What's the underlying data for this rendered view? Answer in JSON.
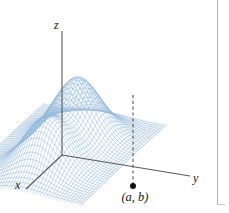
{
  "figure": {
    "kind": "3d-surface-plot",
    "background_color": "#ffffff",
    "border_color": "#b2b2b2",
    "axes": {
      "origin": [
        62,
        155
      ],
      "z_axis": {
        "label": "z",
        "from": [
          62,
          155
        ],
        "to": [
          62,
          31
        ]
      },
      "x_axis": {
        "label": "x",
        "from": [
          62,
          155
        ],
        "to": [
          26,
          189
        ]
      },
      "y_axis": {
        "label": "y",
        "from": [
          62,
          155
        ],
        "to": [
          190,
          176
        ]
      },
      "color": "#5a5a5a"
    },
    "annotations": {
      "point_label": "(a, b)",
      "point_marker": {
        "x": 133,
        "y": 186,
        "radius": 3.0,
        "color": "#111111"
      },
      "drop_line": {
        "from": [
          133,
          95
        ],
        "to": [
          133,
          184
        ],
        "style": "dashed",
        "color": "#555555"
      }
    }
  },
  "chart_data": {
    "type": "line",
    "title": "",
    "subtitle": "",
    "xlabel": "x",
    "ylabel": "y",
    "zlabel": "z",
    "surface_description": "Two-humped wireframe surface with a saddle (local minimum along the ridge) between the peaks; a dashed vertical line drops from the saddle point down to the labelled point (a, b) in the xy-plane.",
    "mesh": {
      "style": "wireframe-crosshatch",
      "line_color": "#7aa8d2",
      "fill_color": "#ffffff",
      "u_lines": 44,
      "v_lines": 46,
      "line_width": 0.45,
      "opacity": 0.8
    },
    "projection": {
      "origin_px": [
        62,
        155
      ],
      "x_unit_px": [
        -0.62,
        0.585
      ],
      "y_unit_px": [
        1.0,
        0.175
      ],
      "z_unit_px": [
        0.0,
        -1.0
      ],
      "z_scale_px": 62
    },
    "surface_function": "z = exp(-(u+0.95)^2 - 0.72 v^2) * 1.0 + exp(-(u-1.0)^2 - 0.78 v^2) * 0.82",
    "domain": {
      "u": [
        -2.65,
        2.6
      ],
      "v": [
        -2.35,
        2.35
      ]
    },
    "peaks": [
      {
        "name": "left-peak",
        "u": -0.95,
        "v": 0.0,
        "z": 1.0,
        "px": [
          100,
          63
        ]
      },
      {
        "name": "right-peak",
        "u": 1.0,
        "v": 0.0,
        "z": 0.82,
        "px": [
          166,
          78
        ]
      }
    ],
    "saddle": {
      "name": "saddle-point",
      "u": 0.03,
      "v": 0.0,
      "z": 0.52,
      "px": [
        133,
        95
      ]
    },
    "gridlines": false,
    "legend": null,
    "axis_ticks": [],
    "ylim": [
      0,
      1.05
    ]
  },
  "labels": {
    "z": "z",
    "x": "x",
    "y": "y",
    "point": "(a, b)"
  }
}
